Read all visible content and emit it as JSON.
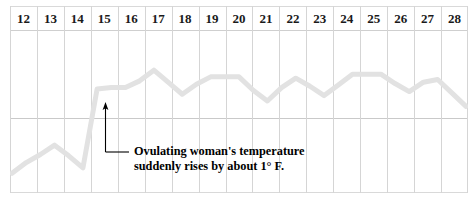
{
  "chart_data": {
    "type": "line",
    "title": "",
    "subtitle": "",
    "xlabel": "",
    "ylabel": "",
    "grid": true,
    "legend": null,
    "axis": {
      "x_tick_labels": [
        "12",
        "13",
        "14",
        "15",
        "16",
        "17",
        "18",
        "19",
        "20",
        "21",
        "22",
        "23",
        "24",
        "25",
        "26",
        "27",
        "28"
      ],
      "x_range": [
        12,
        28
      ],
      "y_range": [
        -1.0,
        1.3
      ],
      "baseline_value": 0,
      "baseline_note": "horizontal reference rule near mid-chart"
    },
    "series": [
      {
        "name": "Basal body temperature",
        "color": "#e2e2e2",
        "line_width_px": 5,
        "x": [
          12,
          12.5,
          13,
          13.5,
          14,
          14.5,
          15,
          15.5,
          16,
          16.5,
          17,
          17.5,
          18,
          18.5,
          19,
          19.5,
          20,
          20.5,
          21,
          21.5,
          22,
          22.5,
          23,
          23.5,
          24,
          24.5,
          25,
          25.5,
          26,
          26.5,
          27,
          27.5,
          28
        ],
        "values": [
          -0.78,
          -0.62,
          -0.5,
          -0.36,
          -0.52,
          -0.7,
          0.48,
          0.5,
          0.5,
          0.6,
          0.76,
          0.58,
          0.4,
          0.55,
          0.66,
          0.66,
          0.66,
          0.46,
          0.3,
          0.5,
          0.64,
          0.52,
          0.38,
          0.54,
          0.7,
          0.7,
          0.7,
          0.56,
          0.44,
          0.58,
          0.62,
          0.42,
          0.22
        ]
      }
    ],
    "annotations": [
      {
        "name": "ovulation-temperature-rise",
        "text_line_1": "Ovulating woman's temperature",
        "text_line_2": "suddenly rises by about  1° F.",
        "arrow_points_to_day": 15,
        "arrow_direction": "up",
        "color": "#000000"
      }
    ],
    "colors": {
      "line": "#e2e2e2",
      "gridline": "#d5d5d5",
      "border": "#d9d9d9",
      "text": "#1a1a1a",
      "annotation": "#000000",
      "background": "#ffffff"
    }
  },
  "chart": {
    "days": [
      {
        "label": "12"
      },
      {
        "label": "13"
      },
      {
        "label": "14"
      },
      {
        "label": "15"
      },
      {
        "label": "16"
      },
      {
        "label": "17"
      },
      {
        "label": "18"
      },
      {
        "label": "19"
      },
      {
        "label": "20"
      },
      {
        "label": "21"
      },
      {
        "label": "22"
      },
      {
        "label": "23"
      },
      {
        "label": "24"
      },
      {
        "label": "25"
      },
      {
        "label": "26"
      },
      {
        "label": "27"
      },
      {
        "label": "28"
      }
    ],
    "annotation": {
      "line1": "Ovulating woman's temperature",
      "line2": "suddenly rises by about  1° F.",
      "full": "Ovulating woman's temperature\nsuddenly rises by about  1° F."
    }
  }
}
